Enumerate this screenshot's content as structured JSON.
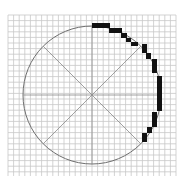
{
  "diagram": {
    "grid": {
      "x0": 8,
      "y0": 15,
      "x1": 176,
      "y1": 176,
      "cell": 5.6,
      "color": "#c8c8c8"
    },
    "circle": {
      "cx": 92,
      "cy": 95,
      "r": 69,
      "stroke": "#6e6e6e"
    },
    "axes_color": "#8a8a8a",
    "pixel_color": "#111111",
    "pixels": [
      [
        92,
        23,
        18,
        5
      ],
      [
        109,
        28,
        13,
        5
      ],
      [
        121,
        33,
        6,
        5
      ],
      [
        126,
        38,
        5,
        4
      ],
      [
        131,
        42,
        7,
        4
      ],
      [
        142,
        44,
        5,
        9
      ],
      [
        146,
        53,
        5,
        6
      ],
      [
        152,
        59,
        5,
        14
      ],
      [
        157,
        76,
        5,
        35
      ],
      [
        152,
        112,
        5,
        15
      ],
      [
        147,
        127,
        5,
        6
      ],
      [
        142,
        133,
        5,
        9
      ]
    ]
  }
}
